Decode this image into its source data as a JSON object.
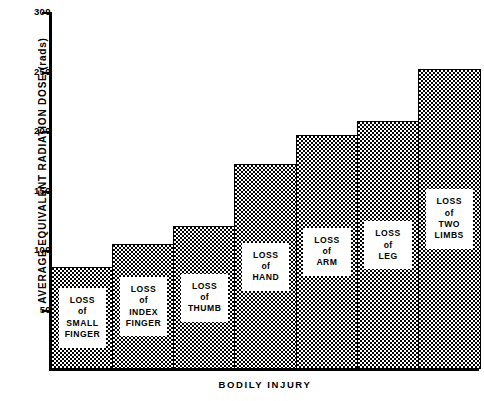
{
  "chart_data": {
    "type": "bar",
    "title": "",
    "xlabel": "BODILY  INJURY",
    "ylabel": "AVERAGE  EQUIVALENT  RADIATION  DOSE   (rads)",
    "ylim": [
      0,
      300
    ],
    "yticks": [
      50,
      100,
      150,
      200,
      250,
      300
    ],
    "ytick_labels": [
      "50",
      "100",
      "150",
      "200",
      "250",
      "300"
    ],
    "grid": false,
    "legend": null,
    "categories": [
      "LOSS of SMALL FINGER",
      "LOSS of INDEX FINGER",
      "LOSS of THUMB",
      "LOSS of HAND",
      "LOSS of ARM",
      "LOSS of LEG",
      "LOSS of TWO LIMBS"
    ],
    "values": [
      86,
      105,
      120,
      172,
      197,
      208,
      252
    ],
    "bar_labels": [
      {
        "line1": "LOSS",
        "line2": "of",
        "line3": "SMALL",
        "line4": "FINGER"
      },
      {
        "line1": "LOSS",
        "line2": "of",
        "line3": "INDEX",
        "line4": "FINGER"
      },
      {
        "line1": "LOSS",
        "line2": "of",
        "line3": "THUMB",
        "line4": ""
      },
      {
        "line1": "LOSS",
        "line2": "of",
        "line3": "HAND",
        "line4": ""
      },
      {
        "line1": "LOSS",
        "line2": "of",
        "line3": "ARM",
        "line4": ""
      },
      {
        "line1": "LOSS",
        "line2": "of",
        "line3": "LEG",
        "line4": ""
      },
      {
        "line1": "LOSS",
        "line2": "of",
        "line3": "TWO",
        "line4": "LIMBS"
      }
    ],
    "colors": {
      "axis": "#000000",
      "bar_edge": "#000000",
      "bar_fill": "#000000",
      "background": "#ffffff",
      "label_box": "#ffffff"
    }
  }
}
